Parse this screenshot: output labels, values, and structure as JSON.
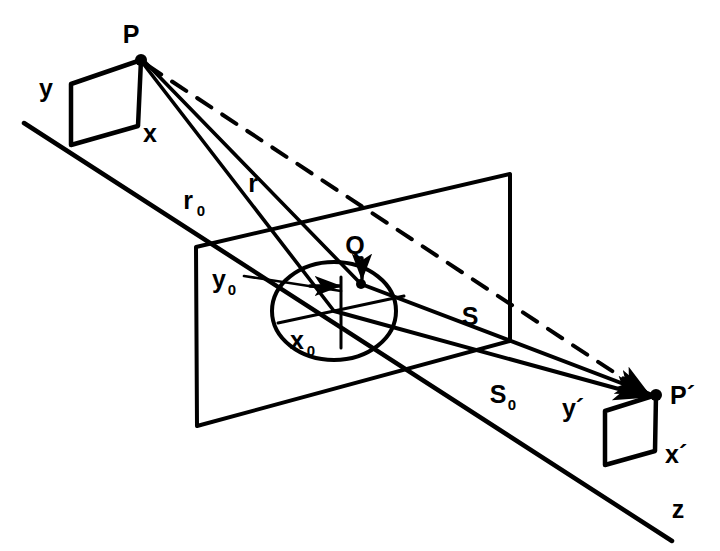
{
  "figure": {
    "background_color": "#ffffff",
    "ink_color": "#000000"
  },
  "labels": {
    "source_point": "P",
    "source_y": "y",
    "source_x": "x",
    "ray_r0": "r",
    "ray_r0_sub": "0",
    "ray_r": "r",
    "aperture_point": "Q",
    "aperture_y0": "y",
    "aperture_y0_sub": "0",
    "aperture_x0": "x",
    "aperture_x0_sub": "0",
    "ray_s": "S",
    "ray_s0": "S",
    "ray_s0_sub": "0",
    "image_point": "P´",
    "image_y": "y´",
    "image_x": "x´",
    "axis_z": "z"
  },
  "geometry": {
    "z_axis": {
      "x1": 24,
      "y1": 123,
      "x2": 672,
      "y2": 541
    },
    "source_point_xy": {
      "x": 141,
      "y": 60
    },
    "image_point_xy": {
      "x": 656,
      "y": 395
    },
    "aperture_center_xy": {
      "x": 334,
      "y": 311
    },
    "aperture_point_q_xy": {
      "x": 361,
      "y": 284
    },
    "source_parallelogram": [
      {
        "x": 141,
        "y": 60
      },
      {
        "x": 71,
        "y": 84
      },
      {
        "x": 71,
        "y": 145
      },
      {
        "x": 138,
        "y": 126
      }
    ],
    "image_parallelogram": [
      {
        "x": 656,
        "y": 395
      },
      {
        "x": 605,
        "y": 411
      },
      {
        "x": 605,
        "y": 465
      },
      {
        "x": 655,
        "y": 451
      }
    ],
    "aperture_plane": [
      {
        "x": 196,
        "y": 247
      },
      {
        "x": 510,
        "y": 174
      },
      {
        "x": 510,
        "y": 341
      },
      {
        "x": 197,
        "y": 426
      }
    ],
    "aperture_ellipse": {
      "cx": 334,
      "cy": 311,
      "rx": 62,
      "ry": 49
    },
    "dashed_line": {
      "x1": 145,
      "y1": 64,
      "x2": 652,
      "y2": 397
    },
    "line_r0": {
      "x1": 143,
      "y1": 63,
      "x2": 334,
      "y2": 311
    },
    "line_r": {
      "x1": 145,
      "y1": 63,
      "x2": 361,
      "y2": 284
    },
    "line_S": {
      "x1": 361,
      "y1": 284,
      "x2": 652,
      "y2": 394
    },
    "line_S0": {
      "x1": 334,
      "y1": 311,
      "x2": 650,
      "y2": 397
    }
  },
  "label_positions": {
    "P": {
      "x": 131,
      "y": 43
    },
    "y": {
      "x": 46,
      "y": 92
    },
    "x": {
      "x": 148,
      "y": 140
    },
    "r0": {
      "x": 190,
      "y": 206
    },
    "r": {
      "x": 254,
      "y": 185
    },
    "Q": {
      "x": 354,
      "y": 248
    },
    "y0": {
      "x": 216,
      "y": 290
    },
    "x0": {
      "x": 294,
      "y": 344
    },
    "S": {
      "x": 468,
      "y": 317
    },
    "S0": {
      "x": 497,
      "y": 395
    },
    "Pp": {
      "x": 668,
      "y": 403
    },
    "yp": {
      "x": 570,
      "y": 409
    },
    "xp": {
      "x": 662,
      "y": 456
    },
    "z": {
      "x": 680,
      "y": 510
    }
  }
}
